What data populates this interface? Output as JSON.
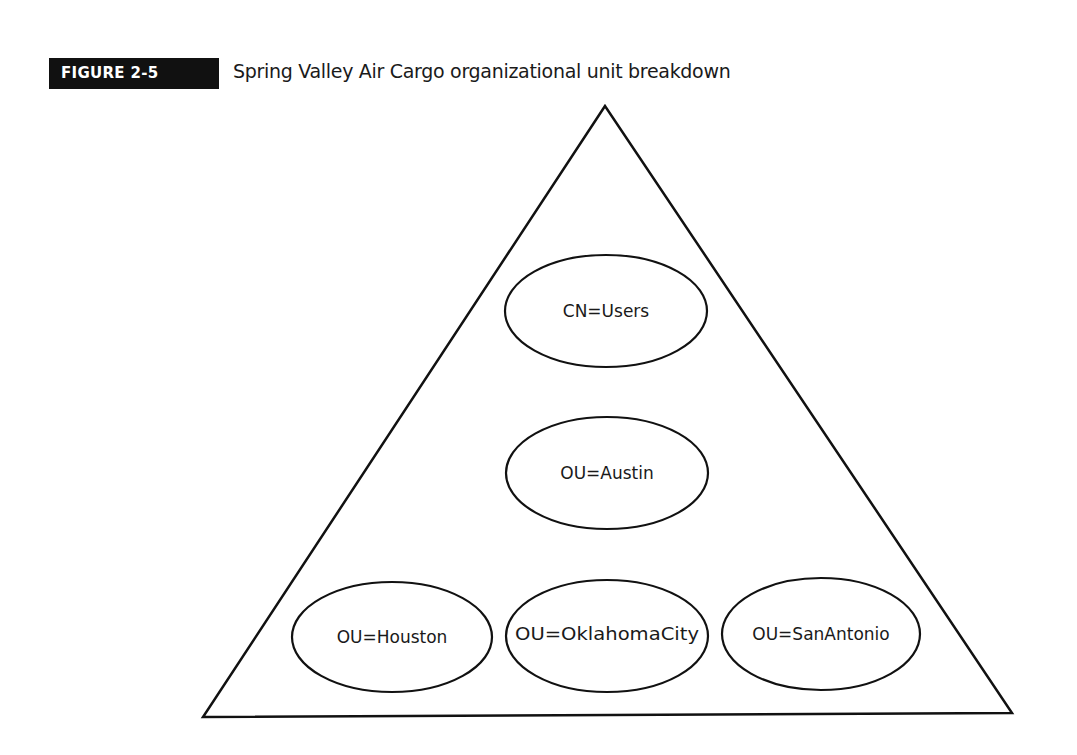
{
  "figure": {
    "label": "FIGURE 2-5",
    "title": "Spring Valley Air Cargo organizational unit breakdown"
  },
  "diagram": {
    "shape": "triangle",
    "nodes": [
      {
        "id": "users",
        "label": "CN=Users",
        "cx": 606,
        "cy": 311,
        "rx": 101,
        "ry": 56
      },
      {
        "id": "austin",
        "label": "OU=Austin",
        "cx": 607,
        "cy": 473,
        "rx": 101,
        "ry": 56
      },
      {
        "id": "houston",
        "label": "OU=Houston",
        "cx": 392,
        "cy": 637,
        "rx": 100,
        "ry": 55
      },
      {
        "id": "oklahomacity",
        "label": "OU=OklahomaCity",
        "cx": 607,
        "cy": 636,
        "rx": 101,
        "ry": 56
      },
      {
        "id": "sanantonio",
        "label": "OU=SanAntonio",
        "cx": 821,
        "cy": 634,
        "rx": 99,
        "ry": 56
      }
    ]
  }
}
